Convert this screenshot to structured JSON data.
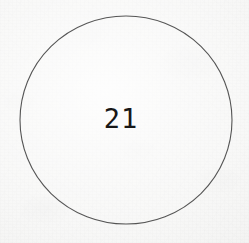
{
  "document": {
    "kind": "scanned-page",
    "background_color": "#f6f6f5",
    "width": 249,
    "height": 243
  },
  "figure": {
    "name": "circled-number",
    "shape": "circle",
    "outline_color": "#555555",
    "outline_width_px": 1,
    "fill": "none",
    "center_x": 126,
    "center_y": 120,
    "radius_x": 106,
    "radius_y": 104,
    "value": "21",
    "value_color": "#171717"
  }
}
